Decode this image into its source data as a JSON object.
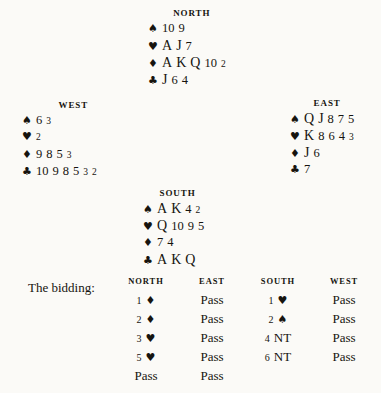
{
  "document": {
    "type": "bridge-hand-diagram",
    "background_color": "#fbfaf7",
    "text_color": "#16140f"
  },
  "suit_glyphs": {
    "spade": "♠",
    "heart": "♥",
    "diamond": "♦",
    "club": "♣"
  },
  "hands": {
    "north": {
      "label": "NORTH",
      "suits": [
        {
          "suit": "spade",
          "symbol": "♠",
          "cards": "10 9"
        },
        {
          "suit": "heart",
          "symbol": "♥",
          "cards": "A J 7"
        },
        {
          "suit": "diamond",
          "symbol": "♦",
          "cards": "A K Q 10 2"
        },
        {
          "suit": "club",
          "symbol": "♣",
          "cards": "J 6 4"
        }
      ]
    },
    "west": {
      "label": "WEST",
      "suits": [
        {
          "suit": "spade",
          "symbol": "♠",
          "cards": "6 3"
        },
        {
          "suit": "heart",
          "symbol": "♥",
          "cards": "2"
        },
        {
          "suit": "diamond",
          "symbol": "♦",
          "cards": "9 8 5 3"
        },
        {
          "suit": "club",
          "symbol": "♣",
          "cards": "10 9 8 5 3 2"
        }
      ]
    },
    "east": {
      "label": "EAST",
      "suits": [
        {
          "suit": "spade",
          "symbol": "♠",
          "cards": "Q J 8 7 5"
        },
        {
          "suit": "heart",
          "symbol": "♥",
          "cards": "K 8 6 4 3"
        },
        {
          "suit": "diamond",
          "symbol": "♦",
          "cards": "J 6"
        },
        {
          "suit": "club",
          "symbol": "♣",
          "cards": "7"
        }
      ]
    },
    "south": {
      "label": "SOUTH",
      "suits": [
        {
          "suit": "spade",
          "symbol": "♠",
          "cards": "A K 4 2"
        },
        {
          "suit": "heart",
          "symbol": "♥",
          "cards": "Q 10 9 5"
        },
        {
          "suit": "diamond",
          "symbol": "♦",
          "cards": "7 4"
        },
        {
          "suit": "club",
          "symbol": "♣",
          "cards": "A K Q"
        }
      ]
    }
  },
  "bidding": {
    "title": "The bidding:",
    "columns": [
      "NORTH",
      "EAST",
      "SOUTH",
      "WEST"
    ],
    "rows": [
      [
        {
          "level": "1",
          "suit": "♦",
          "kind": "suit"
        },
        {
          "text": "Pass",
          "kind": "pass"
        },
        {
          "level": "1",
          "suit": "♥",
          "kind": "suit"
        },
        {
          "text": "Pass",
          "kind": "pass"
        }
      ],
      [
        {
          "level": "2",
          "suit": "♦",
          "kind": "suit"
        },
        {
          "text": "Pass",
          "kind": "pass"
        },
        {
          "level": "2",
          "suit": "♠",
          "kind": "suit"
        },
        {
          "text": "Pass",
          "kind": "pass"
        }
      ],
      [
        {
          "level": "3",
          "suit": "♥",
          "kind": "suit"
        },
        {
          "text": "Pass",
          "kind": "pass"
        },
        {
          "level": "4",
          "suit": "NT",
          "kind": "nt"
        },
        {
          "text": "Pass",
          "kind": "pass"
        }
      ],
      [
        {
          "level": "5",
          "suit": "♥",
          "kind": "suit"
        },
        {
          "text": "Pass",
          "kind": "pass"
        },
        {
          "level": "6",
          "suit": "NT",
          "kind": "nt"
        },
        {
          "text": "Pass",
          "kind": "pass"
        }
      ],
      [
        {
          "text": "Pass",
          "kind": "pass"
        },
        {
          "text": "Pass",
          "kind": "pass"
        },
        {
          "text": "",
          "kind": "empty"
        },
        {
          "text": "",
          "kind": "empty"
        }
      ]
    ]
  }
}
